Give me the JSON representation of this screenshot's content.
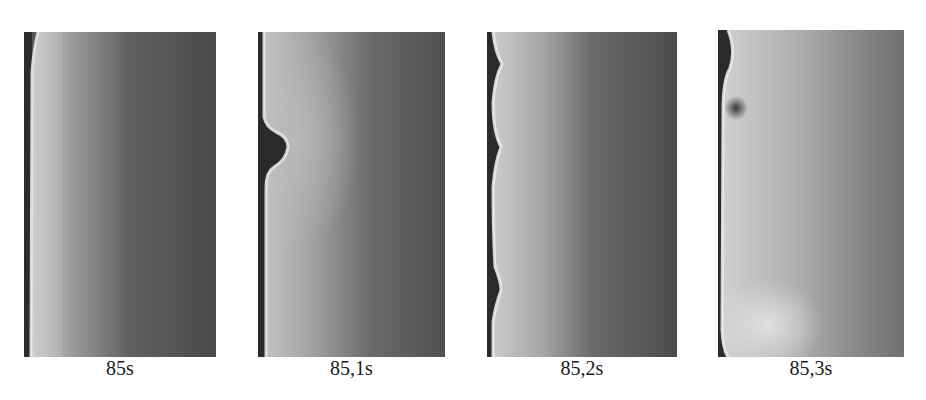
{
  "figure": {
    "background": "#ffffff",
    "panels": [
      {
        "id": "frame-1",
        "time_label": "85s",
        "description": "Flat vertical bright front along left wall; dark gray field on right"
      },
      {
        "id": "frame-2",
        "time_label": "85,1s",
        "description": "Single bulge/vortex on left wall near upper third"
      },
      {
        "id": "frame-3",
        "time_label": "85,2s",
        "description": "Wavy front with multiple undulations along left wall"
      },
      {
        "id": "frame-4",
        "time_label": "85,3s",
        "description": "Broad bright region filling most of frame, dark spot near top-left, bright lobe bottom-left"
      }
    ],
    "colors": {
      "wall_dark": "#2a2a2a",
      "front_bright": "#e6e6e6",
      "field_mid": "#8a8a8a",
      "field_dark": "#4a4a4a",
      "caption_text": "#1a1a1a"
    }
  }
}
